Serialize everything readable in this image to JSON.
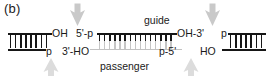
{
  "figure": {
    "panel_label": "(b)",
    "type": "rna-duplex-processing-diagram"
  },
  "labels": {
    "left_duplex_top_end": "OH",
    "left_duplex_bottom_end": "p",
    "center_guide_five_prime": "5'-p",
    "center_guide_three_prime": "OH-3'",
    "center_guide_name": "guide",
    "center_passenger_three_prime": "3'-HO",
    "center_passenger_five_prime": "p-5'",
    "center_passenger_name": "passenger",
    "right_duplex_top_end": "p",
    "right_duplex_bottom_end": "HO"
  },
  "colors": {
    "strand_dark": "#161616",
    "strand_light": "#c2c2c2",
    "arrow_dark": "#c9c9c9",
    "arrow_light": "#dcdcdc",
    "text": "#1a1a1a",
    "background": "#ffffff"
  },
  "duplexes": [
    {
      "name": "left-duplex",
      "top_strand_color": "#161616",
      "bottom_strand_color": "#161616",
      "basepair_count": 8
    },
    {
      "name": "center-duplex",
      "top_strand_label": "guide",
      "top_strand_color": "#161616",
      "bottom_strand_label": "passenger",
      "bottom_strand_color": "#c2c2c2",
      "basepair_count": 21
    },
    {
      "name": "right-duplex",
      "top_strand_color": "#161616",
      "bottom_strand_color": "#161616",
      "basepair_count": 8
    }
  ],
  "arrows": [
    {
      "name": "arrow-top-left",
      "direction": "down",
      "color": "#c9c9c9"
    },
    {
      "name": "arrow-top-right",
      "direction": "down",
      "color": "#c9c9c9"
    },
    {
      "name": "arrow-bottom-left",
      "direction": "up",
      "color": "#dcdcdc"
    },
    {
      "name": "arrow-bottom-right",
      "direction": "up",
      "color": "#dcdcdc"
    }
  ]
}
